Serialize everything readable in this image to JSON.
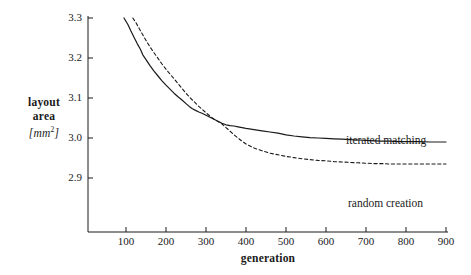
{
  "chart_data": {
    "type": "line",
    "title": "",
    "subtitle": "",
    "xlabel": "generation",
    "ylabel": "layout area",
    "ylabel_lines": [
      "layout",
      "area"
    ],
    "yunit": "[mm2]",
    "yunit_base": "[mm",
    "yunit_sup": "2",
    "yunit_close": "]",
    "xlim": [
      60,
      900
    ],
    "ylim": [
      2.865,
      3.3
    ],
    "grid": false,
    "legend_position": "inline-annotations",
    "xticks": [
      100,
      200,
      300,
      400,
      500,
      600,
      700,
      800,
      900
    ],
    "xtick_labels": [
      "100",
      "200",
      "300",
      "400",
      "500",
      "600",
      "700",
      "800",
      "900"
    ],
    "yticks": [
      2.9,
      3.0,
      3.1,
      3.2,
      3.3
    ],
    "ytick_labels": [
      "2.9",
      "3.0",
      "3.1",
      "3.2",
      "3.3"
    ],
    "annotations": [
      {
        "name": "iterated matching",
        "text": "iterated matching"
      },
      {
        "name": "random creation",
        "text": "random creation"
      }
    ],
    "series": [
      {
        "name": "iterated matching",
        "style": "solid",
        "color": "#1a1a1a",
        "x": [
          95,
          105,
          112,
          120,
          128,
          136,
          142,
          150,
          160,
          170,
          180,
          190,
          200,
          210,
          220,
          230,
          240,
          250,
          258,
          266,
          274,
          282,
          290,
          300,
          310,
          320,
          330,
          340,
          350,
          360,
          370,
          380,
          390,
          400,
          420,
          440,
          460,
          480,
          500,
          520,
          540,
          560,
          580,
          600,
          620,
          640,
          660,
          680,
          700,
          720,
          740,
          760,
          780,
          800,
          830,
          860,
          900
        ],
        "y": [
          3.3,
          3.283,
          3.268,
          3.252,
          3.236,
          3.222,
          3.208,
          3.196,
          3.181,
          3.167,
          3.155,
          3.143,
          3.132,
          3.122,
          3.112,
          3.103,
          3.095,
          3.086,
          3.079,
          3.073,
          3.069,
          3.065,
          3.062,
          3.057,
          3.052,
          3.047,
          3.042,
          3.037,
          3.033,
          3.031,
          3.03,
          3.028,
          3.026,
          3.024,
          3.021,
          3.018,
          3.015,
          3.012,
          3.008,
          3.005,
          3.003,
          3.001,
          3.0,
          2.999,
          2.998,
          2.997,
          2.996,
          2.995,
          2.994,
          2.993,
          2.992,
          2.992,
          2.991,
          2.991,
          2.991,
          2.99,
          2.99
        ]
      },
      {
        "name": "random creation",
        "style": "dashed",
        "color": "#1a1a1a",
        "x": [
          117,
          125,
          133,
          142,
          150,
          160,
          170,
          180,
          190,
          200,
          210,
          220,
          230,
          240,
          250,
          258,
          266,
          274,
          282,
          290,
          300,
          310,
          320,
          330,
          340,
          350,
          360,
          370,
          380,
          390,
          400,
          420,
          440,
          460,
          480,
          500,
          520,
          540,
          560,
          580,
          600,
          620,
          640,
          660,
          680,
          700,
          720,
          740,
          760,
          780,
          800,
          830,
          860,
          900
        ],
        "y": [
          3.3,
          3.288,
          3.274,
          3.258,
          3.244,
          3.228,
          3.213,
          3.199,
          3.185,
          3.172,
          3.16,
          3.148,
          3.136,
          3.124,
          3.112,
          3.103,
          3.095,
          3.087,
          3.079,
          3.072,
          3.063,
          3.055,
          3.047,
          3.041,
          3.035,
          3.026,
          3.017,
          3.008,
          3.0,
          2.992,
          2.985,
          2.975,
          2.968,
          2.962,
          2.958,
          2.954,
          2.951,
          2.948,
          2.946,
          2.944,
          2.943,
          2.941,
          2.94,
          2.939,
          2.938,
          2.937,
          2.936,
          2.936,
          2.935,
          2.935,
          2.935,
          2.935,
          2.935,
          2.935
        ]
      }
    ]
  }
}
